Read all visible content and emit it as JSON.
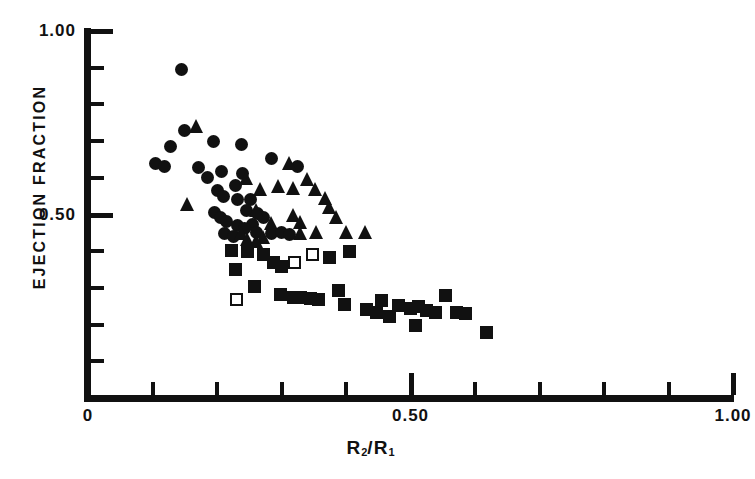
{
  "chart_data": {
    "type": "scatter",
    "title": "",
    "xlabel": "R2/R1",
    "xlabel_parts": {
      "base1": "R",
      "sub1": "2",
      "slash": "/",
      "base2": "R",
      "sub2": "1"
    },
    "ylabel": "EJECTION FRACTION",
    "xlim": [
      0,
      1.0
    ],
    "ylim": [
      0,
      1.0
    ],
    "grid": false,
    "legend": "none",
    "x_ticks": [
      0,
      0.1,
      0.2,
      0.3,
      0.4,
      0.5,
      0.6,
      0.7,
      0.8,
      0.9,
      1.0
    ],
    "x_tick_labels": [
      {
        "value": 0,
        "label": "0"
      },
      {
        "value": 0.5,
        "label": "0.50"
      },
      {
        "value": 1.0,
        "label": "1.00"
      }
    ],
    "y_ticks": [
      0,
      0.1,
      0.2,
      0.3,
      0.4,
      0.5,
      0.6,
      0.7,
      0.8,
      0.9,
      1.0
    ],
    "y_tick_labels": [
      {
        "value": 0.5,
        "label": "0.50"
      },
      {
        "value": 1.0,
        "label": "1.00"
      }
    ],
    "series": [
      {
        "name": "filled-circle",
        "marker": "circle",
        "fill": "solid",
        "color": "#111111",
        "points": [
          [
            0.145,
            0.895
          ],
          [
            0.15,
            0.73
          ],
          [
            0.128,
            0.685
          ],
          [
            0.105,
            0.64
          ],
          [
            0.118,
            0.632
          ],
          [
            0.195,
            0.7
          ],
          [
            0.172,
            0.628
          ],
          [
            0.238,
            0.69
          ],
          [
            0.207,
            0.618
          ],
          [
            0.24,
            0.612
          ],
          [
            0.185,
            0.6
          ],
          [
            0.285,
            0.652
          ],
          [
            0.325,
            0.63
          ],
          [
            0.2,
            0.565
          ],
          [
            0.21,
            0.548
          ],
          [
            0.228,
            0.578
          ],
          [
            0.232,
            0.542
          ],
          [
            0.252,
            0.54
          ],
          [
            0.196,
            0.505
          ],
          [
            0.205,
            0.492
          ],
          [
            0.215,
            0.48
          ],
          [
            0.232,
            0.47
          ],
          [
            0.245,
            0.512
          ],
          [
            0.263,
            0.502
          ],
          [
            0.272,
            0.492
          ],
          [
            0.255,
            0.472
          ],
          [
            0.242,
            0.462
          ],
          [
            0.212,
            0.448
          ],
          [
            0.225,
            0.44
          ],
          [
            0.262,
            0.452
          ],
          [
            0.285,
            0.448
          ],
          [
            0.3,
            0.452
          ],
          [
            0.312,
            0.445
          ]
        ]
      },
      {
        "name": "filled-triangle",
        "marker": "triangle",
        "fill": "solid",
        "color": "#111111",
        "points": [
          [
            0.168,
            0.742
          ],
          [
            0.155,
            0.528
          ],
          [
            0.245,
            0.6
          ],
          [
            0.268,
            0.57
          ],
          [
            0.295,
            0.578
          ],
          [
            0.312,
            0.64
          ],
          [
            0.318,
            0.572
          ],
          [
            0.34,
            0.598
          ],
          [
            0.352,
            0.57
          ],
          [
            0.368,
            0.545
          ],
          [
            0.375,
            0.52
          ],
          [
            0.262,
            0.512
          ],
          [
            0.285,
            0.478
          ],
          [
            0.318,
            0.5
          ],
          [
            0.33,
            0.48
          ],
          [
            0.238,
            0.45
          ],
          [
            0.248,
            0.432
          ],
          [
            0.272,
            0.44
          ],
          [
            0.33,
            0.45
          ],
          [
            0.355,
            0.452
          ],
          [
            0.385,
            0.492
          ],
          [
            0.4,
            0.452
          ],
          [
            0.43,
            0.452
          ],
          [
            0.262,
            0.428
          ]
        ]
      },
      {
        "name": "filled-square",
        "marker": "square",
        "fill": "solid",
        "color": "#111111",
        "points": [
          [
            0.222,
            0.402
          ],
          [
            0.248,
            0.398
          ],
          [
            0.272,
            0.392
          ],
          [
            0.288,
            0.368
          ],
          [
            0.3,
            0.358
          ],
          [
            0.228,
            0.35
          ],
          [
            0.375,
            0.382
          ],
          [
            0.405,
            0.4
          ],
          [
            0.258,
            0.305
          ],
          [
            0.298,
            0.282
          ],
          [
            0.318,
            0.275
          ],
          [
            0.33,
            0.275
          ],
          [
            0.345,
            0.272
          ],
          [
            0.358,
            0.268
          ],
          [
            0.388,
            0.292
          ],
          [
            0.398,
            0.255
          ],
          [
            0.432,
            0.24
          ],
          [
            0.448,
            0.232
          ],
          [
            0.455,
            0.265
          ],
          [
            0.468,
            0.222
          ],
          [
            0.482,
            0.252
          ],
          [
            0.5,
            0.245
          ],
          [
            0.512,
            0.248
          ],
          [
            0.525,
            0.238
          ],
          [
            0.538,
            0.232
          ],
          [
            0.508,
            0.198
          ],
          [
            0.555,
            0.278
          ],
          [
            0.572,
            0.232
          ],
          [
            0.585,
            0.23
          ],
          [
            0.618,
            0.178
          ]
        ]
      },
      {
        "name": "open-square",
        "marker": "square",
        "fill": "open",
        "color": "#111111",
        "points": [
          [
            0.348,
            0.392
          ],
          [
            0.32,
            0.368
          ],
          [
            0.23,
            0.268
          ]
        ]
      }
    ]
  }
}
